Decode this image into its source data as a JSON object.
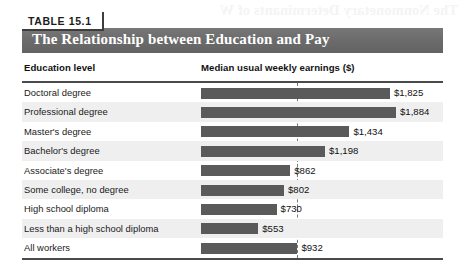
{
  "table": {
    "badge_label": "TABLE 15.1",
    "title": "The Relationship between Education and Pay",
    "bleed_text": "The Nonmonetary Determinants of W",
    "columns": {
      "left": "Education level",
      "right": "Median usual weekly earnings ($)"
    }
  },
  "colors": {
    "title_bar": "#6e6e6e",
    "bar": "#5a5a5a",
    "rule": "#4a4a4a",
    "row_alt": "#efefef",
    "ref_line": "#777777"
  },
  "chart_data": {
    "type": "bar",
    "title": "The Relationship between Education and Pay",
    "xlabel": "Median usual weekly earnings ($)",
    "ylabel": "Education level",
    "orientation": "horizontal",
    "grid": false,
    "legend": "none",
    "xlim": [
      0,
      1884
    ],
    "reference_line": {
      "label": "All workers",
      "value": 932
    },
    "categories": [
      "Doctoral degree",
      "Professional degree",
      "Master's degree",
      "Bachelor's degree",
      "Associate's degree",
      "Some college, no degree",
      "High school diploma",
      "Less than a high school diploma",
      "All workers"
    ],
    "values": [
      1825,
      1884,
      1434,
      1198,
      862,
      802,
      730,
      553,
      932
    ],
    "value_labels": [
      "$1,825",
      "$1,884",
      "$1,434",
      "$1,198",
      "$862",
      "$802",
      "$730",
      "$553",
      "$932"
    ]
  }
}
